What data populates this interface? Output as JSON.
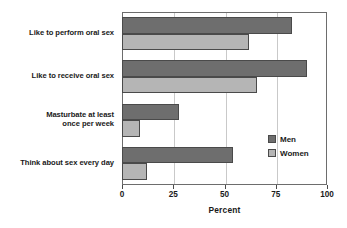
{
  "chart_data": {
    "type": "bar",
    "orientation": "horizontal",
    "title": "",
    "xlabel": "Percent",
    "ylabel": "",
    "xlim": [
      0,
      100
    ],
    "xticks": [
      0,
      25,
      50,
      75,
      100
    ],
    "xtick_labels": [
      "0",
      "25",
      "50",
      "75",
      "100"
    ],
    "grid": true,
    "grid_axis": "x",
    "legend_position": "center-right",
    "categories": [
      "Like to perform oral sex",
      "Like to receive oral sex",
      "Masturbate at least once per week",
      "Think about sex every day"
    ],
    "category_label_lines": [
      [
        "Like to perform oral sex"
      ],
      [
        "Like to receive oral sex"
      ],
      [
        "Masturbate at least",
        "once per week"
      ],
      [
        "Think about sex every day"
      ]
    ],
    "series": [
      {
        "name": "Men",
        "color": "#6e6e6e",
        "values": [
          83,
          90,
          28,
          54
        ]
      },
      {
        "name": "Women",
        "color": "#b5b5b5",
        "values": [
          62,
          66,
          9,
          12
        ]
      }
    ]
  },
  "legend": {
    "items": [
      {
        "label": "Men",
        "color": "#6e6e6e"
      },
      {
        "label": "Women",
        "color": "#b5b5b5"
      }
    ]
  },
  "axis": {
    "x_title": "Percent",
    "tick_labels": [
      "0",
      "25",
      "50",
      "75",
      "100"
    ]
  },
  "colors": {
    "men": "#6e6e6e",
    "women": "#b5b5b5",
    "frame": "#6d6d6d",
    "grid": "#c9c9c9",
    "bar_edge": "#4a4a4a",
    "background": "#ffffff",
    "text": "#1a1a1a"
  }
}
